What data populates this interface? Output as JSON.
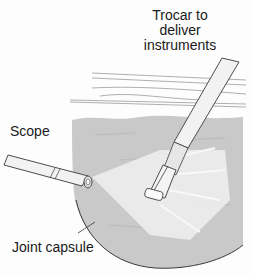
{
  "figure": {
    "labels": {
      "trocar_line1": "Trocar to",
      "trocar_line2": "deliver",
      "trocar_line3": "instruments",
      "scope": "Scope",
      "joint_capsule": "Joint capsule"
    },
    "colors": {
      "capsule_fill": "#c9c9c9",
      "outline": "#3a3a3a",
      "tissue_lines": "#9a9a9a",
      "instrument_fill": "#f2f2f2",
      "light_beam": "#f4f4f4",
      "background": "#fdfdfd"
    }
  }
}
